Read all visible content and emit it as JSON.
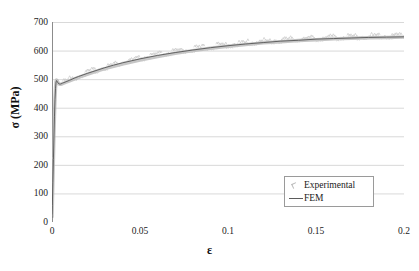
{
  "chart_data": {
    "type": "line",
    "title": "",
    "xlabel": "ε",
    "ylabel": "σ (MPa)",
    "xlim": [
      0,
      0.2
    ],
    "ylim": [
      0,
      700
    ],
    "grid": true,
    "grid_axis": "y",
    "legend_position": "lower-right",
    "xticks": [
      0,
      0.05,
      0.1,
      0.15,
      0.2
    ],
    "xtick_labels": [
      "0",
      "0.05",
      "0.1",
      "0.15",
      "0.2"
    ],
    "yticks": [
      0,
      100,
      200,
      300,
      400,
      500,
      600,
      700
    ],
    "ytick_labels": [
      "0",
      "100",
      "200",
      "300",
      "400",
      "500",
      "600",
      "700"
    ],
    "series": [
      {
        "name": "Experimental",
        "style": "scatter-band",
        "color": "#b0b0b0",
        "x": [
          0,
          0.0002,
          0.0005,
          0.0008,
          0.0011,
          0.0014,
          0.0017,
          0.002,
          0.0023,
          0.0026,
          0.003,
          0.0035,
          0.004,
          0.005,
          0.006,
          0.008,
          0.01,
          0.0125,
          0.015,
          0.02,
          0.025,
          0.03,
          0.035,
          0.04,
          0.045,
          0.05,
          0.06,
          0.07,
          0.08,
          0.09,
          0.1,
          0.11,
          0.12,
          0.13,
          0.14,
          0.15,
          0.16,
          0.17,
          0.18,
          0.19,
          0.2
        ],
        "y": [
          18,
          60,
          140,
          220,
          300,
          370,
          430,
          470,
          492,
          497,
          494,
          487,
          483,
          482,
          484,
          489,
          494,
          500,
          506,
          517,
          527,
          537,
          545,
          553,
          560,
          567,
          579,
          590,
          600,
          608,
          615,
          621,
          627,
          631,
          635,
          638,
          641,
          643,
          645,
          646,
          647
        ]
      },
      {
        "name": "FEM",
        "style": "line",
        "color": "#555555",
        "x": [
          0,
          0.0002,
          0.0005,
          0.0008,
          0.0011,
          0.0014,
          0.0017,
          0.002,
          0.0023,
          0.0026,
          0.003,
          0.0035,
          0.004,
          0.005,
          0.006,
          0.008,
          0.01,
          0.0125,
          0.015,
          0.02,
          0.025,
          0.03,
          0.035,
          0.04,
          0.045,
          0.05,
          0.06,
          0.07,
          0.08,
          0.09,
          0.1,
          0.11,
          0.12,
          0.13,
          0.14,
          0.15,
          0.16,
          0.17,
          0.18,
          0.19,
          0.2
        ],
        "y": [
          15,
          58,
          138,
          218,
          298,
          368,
          428,
          468,
          490,
          495,
          492,
          486,
          483,
          483,
          486,
          491,
          496,
          503,
          509,
          520,
          530,
          540,
          549,
          557,
          564,
          571,
          583,
          593,
          602,
          610,
          617,
          623,
          628,
          633,
          636,
          640,
          642,
          644,
          646,
          647,
          648
        ]
      }
    ],
    "legend_entries": [
      {
        "label": "Experimental",
        "marker": "small-scatter-marker"
      },
      {
        "label": "FEM",
        "marker": "line-segment"
      }
    ],
    "colors": {
      "gridline": "#d9d9d9",
      "axis": "#8c8c8c",
      "experimental": "#b0b0b0",
      "fem": "#555555",
      "text": "#1a1a1a",
      "background": "#ffffff"
    }
  }
}
